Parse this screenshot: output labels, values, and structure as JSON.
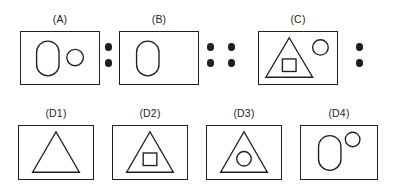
{
  "figure": {
    "type": "visual-analogy-puzzle",
    "format": "A : B :: C : ?",
    "stroke_color": "#231f20",
    "background_color": "#ffffff",
    "dot_color": "#231f20"
  },
  "prompt_row": {
    "panels": [
      {
        "id": "A",
        "label": "(A)",
        "contents": [
          "rounded-oval",
          "small-circle"
        ],
        "description": "rectangle containing a tall rounded oval on the left and a small circle on the right"
      },
      {
        "id": "B",
        "label": "(B)",
        "contents": [
          "rounded-oval"
        ],
        "description": "rectangle containing only a tall rounded oval"
      },
      {
        "id": "C",
        "label": "(C)",
        "contents": [
          "triangle",
          "inner-square",
          "small-circle"
        ],
        "description": "rectangle containing a triangle with a square inside it and a small circle at upper right"
      }
    ],
    "separators": [
      {
        "id": "sep-a-b",
        "glyph": ":",
        "dots": 2,
        "meaning": "is to"
      },
      {
        "id": "sep-b-c",
        "glyph": "::",
        "dots": 4,
        "meaning": "as"
      },
      {
        "id": "sep-c-answer",
        "glyph": ":",
        "dots": 2,
        "meaning": "is to"
      }
    ]
  },
  "options_row": {
    "panels": [
      {
        "id": "D1",
        "label": "(D1)",
        "contents": [
          "triangle"
        ],
        "description": "rectangle containing a plain triangle"
      },
      {
        "id": "D2",
        "label": "(D2)",
        "contents": [
          "triangle",
          "inner-square"
        ],
        "description": "rectangle containing a triangle with a square inside it"
      },
      {
        "id": "D3",
        "label": "(D3)",
        "contents": [
          "triangle",
          "inner-circle"
        ],
        "description": "rectangle containing a triangle with a circle inside it"
      },
      {
        "id": "D4",
        "label": "(D4)",
        "contents": [
          "rounded-oval",
          "small-circle"
        ],
        "description": "rectangle containing a tall rounded oval and a small circle at upper right"
      }
    ]
  }
}
